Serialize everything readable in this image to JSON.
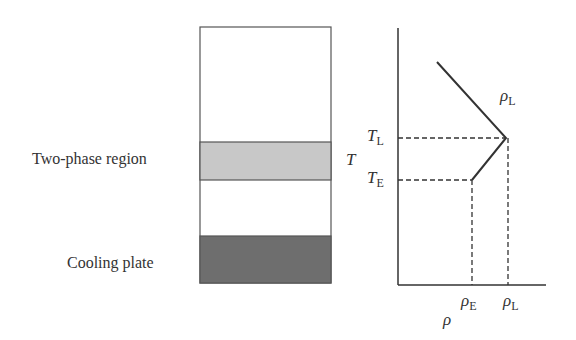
{
  "left_labels": {
    "two_phase": "Two-phase region",
    "cooling_plate": "Cooling plate"
  },
  "axis_labels": {
    "y": "T",
    "x": "ρ"
  },
  "tick_labels": {
    "T_L": {
      "main": "T",
      "sub": "L"
    },
    "T_E": {
      "main": "T",
      "sub": "E"
    },
    "rho_E": {
      "main": "ρ",
      "sub": "E"
    },
    "rho_L": {
      "main": "ρ",
      "sub": "L"
    }
  },
  "curve_label": {
    "main": "ρ",
    "sub": "L"
  },
  "colors": {
    "two_phase_fill": "#c8c8c8",
    "cooling_plate_fill": "#6e6e6e",
    "line": "#333333"
  }
}
